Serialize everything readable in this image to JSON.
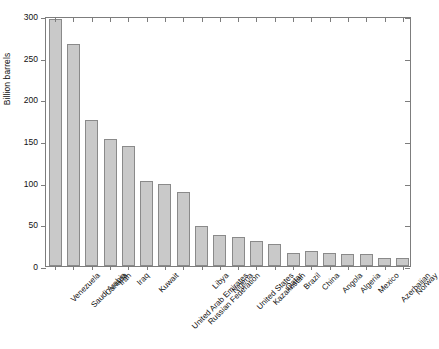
{
  "chart_data": {
    "type": "bar",
    "title": "",
    "xlabel": "",
    "ylabel": "Billion barrels",
    "ylim": [
      0,
      300
    ],
    "yticks": [
      0,
      50,
      100,
      150,
      200,
      250,
      300
    ],
    "grid": false,
    "legend": null,
    "bar_color": "#c9c9c9",
    "bar_edge_color": "#8a8a8a",
    "categories": [
      "Venezuela",
      "Saudi Arabia",
      "Canada",
      "Iran",
      "Iraq",
      "Kuwait",
      "United Arab Emirates",
      "Russian Federation",
      "Libya",
      "Nigeria",
      "United States",
      "Kazakhstan",
      "Qatar",
      "Brazil",
      "China",
      "Angola",
      "Algeria",
      "Mexico",
      "Azerbaijan",
      "Norway"
    ],
    "values": [
      297,
      266,
      175,
      152,
      144,
      102,
      98,
      89,
      48,
      37,
      35,
      30,
      26,
      16,
      18,
      16,
      15,
      14,
      10,
      10
    ]
  },
  "caption": {
    "text": ""
  }
}
